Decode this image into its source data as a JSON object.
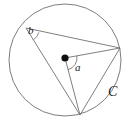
{
  "figure": {
    "type": "geometry-diagram",
    "background_color": "#ffffff",
    "stroke_color": "#6e6e6e",
    "label_color": "#1a1a1a",
    "dot_color": "#101010"
  },
  "labels": {
    "inscribed_angle": "b",
    "central_angle": "a",
    "circle_name": "C"
  },
  "geometry": {
    "circle": {
      "center_x": 65,
      "center_y": 60,
      "radius": 56
    },
    "center_point": {
      "x": 65,
      "y": 58,
      "radius": 3.6
    },
    "points": {
      "upper_left": {
        "x": 26,
        "y": 28
      },
      "right": {
        "x": 120,
        "y": 48
      },
      "bottom": {
        "x": 80,
        "y": 115
      }
    },
    "segments": [
      {
        "name": "chord-upperleft-to-right",
        "x1": 26,
        "y1": 28,
        "x2": 120,
        "y2": 48
      },
      {
        "name": "chord-upperleft-to-bottom",
        "x1": 26,
        "y1": 28,
        "x2": 80,
        "y2": 115
      },
      {
        "name": "chord-right-to-bottom",
        "x1": 120,
        "y1": 48,
        "x2": 80,
        "y2": 115
      },
      {
        "name": "radius-center-to-right",
        "x1": 65,
        "y1": 58,
        "x2": 120,
        "y2": 48
      },
      {
        "name": "radius-center-to-bottom",
        "x1": 65,
        "y1": 58,
        "x2": 80,
        "y2": 115
      }
    ],
    "angle_arcs": [
      {
        "name": "arc-inscribed-b",
        "path": "M 38.9 32.3 A 13.5 13.5 0 0 1 33.3 39.9"
      },
      {
        "name": "arc-central-a",
        "path": "M 76.8 55.9 A 12 12 0 0 1 67.9 69.7"
      }
    ]
  }
}
